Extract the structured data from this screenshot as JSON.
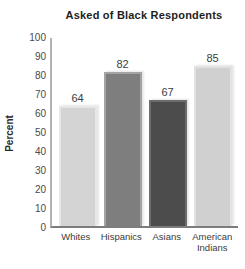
{
  "chart_data": {
    "type": "bar",
    "title": "Asked of Black Respondents",
    "xlabel": "",
    "ylabel": "Percent",
    "categories": [
      "Whites",
      "Hispanics",
      "Asians",
      "American Indians"
    ],
    "values": [
      64,
      82,
      67,
      85
    ],
    "ylim": [
      0,
      100
    ],
    "ytick_step": 10,
    "yticks": [
      100,
      90,
      80,
      70,
      60,
      50,
      40,
      30,
      20,
      10,
      0
    ],
    "grid": false,
    "legend_position": "none",
    "style": {
      "bar_colors": [
        "#d4d4d4",
        "#7e7e7e",
        "#4c4c4c",
        "#d0d0d0"
      ],
      "bar_edge_colors": [
        "#e7e7e7",
        "#a4a4a4",
        "#6c6c6c",
        "#e2e2e2"
      ],
      "y_axis_color": "#b2b2b2",
      "x_axis_color": "#7d7d7d",
      "title_color": "#1e1e1e",
      "tick_text_color": "#4a4a4a",
      "value_label_color": "#3d3d3d",
      "category_label_color": "#3c3c3c",
      "background_color": "#ffffff"
    }
  }
}
